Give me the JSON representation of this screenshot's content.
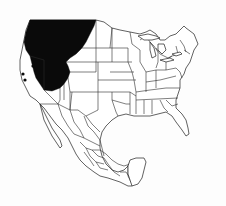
{
  "map": {
    "type": "species-range-map",
    "region": "North America (USA and Mexico)",
    "colors": {
      "background": "#ffffff",
      "borders": "#2a2a2a",
      "range_fill": "#0a0a0a"
    },
    "range": {
      "label": "Distribution range",
      "description": "Solid black region covering the north-western United States (Washington, Oregon interior, Idaho, western Montana, northern Nevada/Utah area)"
    },
    "isolated_points": [
      {
        "label": "Isolated record",
        "x": 33,
        "y": 66
      },
      {
        "label": "Isolated record",
        "x": 23,
        "y": 74
      },
      {
        "label": "Isolated record",
        "x": 25,
        "y": 80
      }
    ]
  }
}
